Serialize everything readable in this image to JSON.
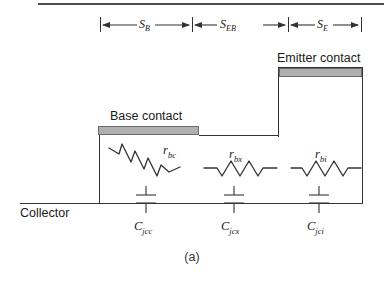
{
  "figure": {
    "caption": "(a)",
    "title_rule": true
  },
  "dimensions": [
    {
      "name": "S_B",
      "base": "S",
      "sub": "B",
      "x_start": 100,
      "x_end": 192
    },
    {
      "name": "S_EB",
      "base": "S",
      "sub": "EB",
      "x_start": 192,
      "x_end": 288
    },
    {
      "name": "S_E",
      "base": "S",
      "sub": "E",
      "x_start": 288,
      "x_end": 361
    }
  ],
  "contacts": {
    "base": {
      "label": "Base contact",
      "bar_x": 98,
      "bar_y": 126,
      "bar_w": 101,
      "bar_h": 9
    },
    "emitter": {
      "label": "Emitter contact",
      "bar_x": 279,
      "bar_y": 68,
      "bar_w": 83,
      "bar_h": 9
    }
  },
  "terminals": {
    "collector": "Collector"
  },
  "resistors": [
    {
      "name": "r_bc",
      "base": "r",
      "sub": "bc",
      "orientation": "diagonal"
    },
    {
      "name": "r_bx",
      "base": "r",
      "sub": "bx",
      "orientation": "horizontal"
    },
    {
      "name": "r_bi",
      "base": "r",
      "sub": "bi",
      "orientation": "horizontal"
    }
  ],
  "capacitors": [
    {
      "name": "C_jcc",
      "base": "C",
      "sub": "jcc"
    },
    {
      "name": "C_jcx",
      "base": "C",
      "sub": "jcx"
    },
    {
      "name": "C_jci",
      "base": "C",
      "sub": "jci"
    }
  ],
  "colors": {
    "line": "#333333",
    "contact_fill": "#b0b0b0",
    "contact_stroke": "#6b6b6b",
    "rule": "#4d4d4d",
    "text": "#1a1a1a"
  }
}
